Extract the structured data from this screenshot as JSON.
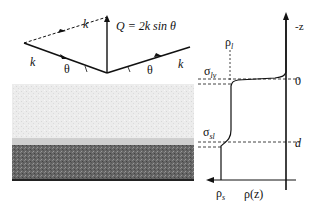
{
  "scattering": {
    "incident_k": "k",
    "scattered_k": "k",
    "dashed_k": "k",
    "theta_in": "θ",
    "theta_out": "θ",
    "q_equation": "Q = 2k sin θ"
  },
  "profile": {
    "axis_z": "-z",
    "zero_label": "0",
    "d_label": "d",
    "rho_l_base": "ρ",
    "rho_l_sub": "l",
    "rho_s_base": "ρ",
    "rho_s_sub": "s",
    "rho_z": "ρ(z)",
    "sigma_lv_base": "σ",
    "sigma_lv_sub": "lv",
    "sigma_sl_base": "σ",
    "sigma_sl_sub": "sl"
  },
  "colors": {
    "liquid": "#e8e8e8",
    "interface_band": "#d4d4d4",
    "substrate": "#6a6a6a",
    "ink": "#111111"
  }
}
